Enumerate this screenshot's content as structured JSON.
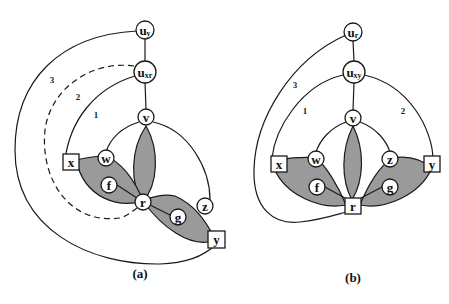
{
  "figure": {
    "panels": [
      {
        "id": "a",
        "caption": "(a)",
        "nodes": {
          "u_top": {
            "main": "u",
            "sub": "y",
            "shape": "circle"
          },
          "u_mid": {
            "main": "u",
            "sub": "xr",
            "shape": "circle"
          },
          "v": {
            "label": "v",
            "shape": "circle"
          },
          "w": {
            "label": "w",
            "shape": "circle"
          },
          "f": {
            "label": "f",
            "shape": "circle"
          },
          "r": {
            "label": "r",
            "shape": "circle"
          },
          "g": {
            "label": "g",
            "shape": "circle"
          },
          "z": {
            "label": "z",
            "shape": "circle"
          },
          "x": {
            "label": "x",
            "shape": "square"
          },
          "y": {
            "label": "y",
            "shape": "square"
          }
        },
        "edge_labels": {
          "e1": "1",
          "e2": "2",
          "e3": "3"
        },
        "dashed_edge": "2"
      },
      {
        "id": "b",
        "caption": "(b)",
        "nodes": {
          "u_top": {
            "main": "u",
            "sub": "r",
            "shape": "circle"
          },
          "u_mid": {
            "main": "u",
            "sub": "xy",
            "shape": "circle"
          },
          "v": {
            "label": "v",
            "shape": "circle"
          },
          "w": {
            "label": "w",
            "shape": "circle"
          },
          "f": {
            "label": "f",
            "shape": "circle"
          },
          "r": {
            "label": "r",
            "shape": "square"
          },
          "g": {
            "label": "g",
            "shape": "circle"
          },
          "z": {
            "label": "z",
            "shape": "circle"
          },
          "x": {
            "label": "x",
            "shape": "square"
          },
          "y": {
            "label": "y",
            "shape": "square"
          }
        },
        "edge_labels": {
          "e1": "1",
          "e2": "2",
          "e3": "3"
        }
      }
    ],
    "colors": {
      "lobe_fill": "#9a9a9a",
      "stroke": "#1a1a1a",
      "background": "#ffffff"
    }
  }
}
